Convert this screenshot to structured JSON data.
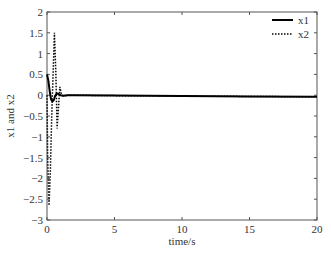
{
  "chart_data": {
    "type": "line",
    "title": "",
    "xlabel": "time/s",
    "ylabel": "x1 and x2",
    "xlim": [
      0,
      20
    ],
    "ylim": [
      -3,
      2
    ],
    "xticks": [
      0,
      5,
      10,
      15,
      20
    ],
    "xtick_labels": [
      "0",
      "5",
      "10",
      "15",
      "20"
    ],
    "yticks": [
      -3,
      -2.5,
      -2,
      -1.5,
      -1,
      -0.5,
      0,
      0.5,
      1,
      1.5,
      2
    ],
    "ytick_labels": [
      "-3",
      "-2.5",
      "-2",
      "-1.5",
      "-1",
      "-0.5",
      "0",
      "0.5",
      "1",
      "1.5",
      "2"
    ],
    "grid": false,
    "legend_position": "upper right",
    "series": [
      {
        "name": "x1",
        "style": "solid",
        "color": "#000000",
        "x": [
          0,
          0.1,
          0.2,
          0.3,
          0.4,
          0.5,
          0.6,
          0.7,
          0.8,
          0.9,
          1.0,
          1.2,
          1.5,
          2,
          5,
          10,
          15,
          20
        ],
        "y": [
          0.5,
          0.35,
          0.1,
          -0.1,
          -0.15,
          -0.12,
          -0.02,
          0.03,
          0.04,
          0.02,
          0.0,
          -0.01,
          0.0,
          0.0,
          -0.01,
          -0.02,
          -0.03,
          -0.04
        ]
      },
      {
        "name": "x2",
        "style": "dotted",
        "color": "#000000",
        "x": [
          0,
          0.05,
          0.15,
          0.25,
          0.35,
          0.45,
          0.55,
          0.65,
          0.75,
          0.85,
          0.95,
          1.05,
          1.2,
          1.5,
          2,
          5,
          10,
          15,
          20
        ],
        "y": [
          0,
          -1.5,
          -2.65,
          -1.8,
          -0.5,
          0.5,
          1.5,
          0.6,
          -0.8,
          -0.3,
          0.2,
          0.05,
          -0.02,
          0.0,
          0.0,
          -0.01,
          -0.02,
          -0.03,
          -0.04
        ]
      }
    ]
  },
  "legend": {
    "items": [
      {
        "label": "x1",
        "style": "solid"
      },
      {
        "label": "x2",
        "style": "dotted"
      }
    ]
  }
}
